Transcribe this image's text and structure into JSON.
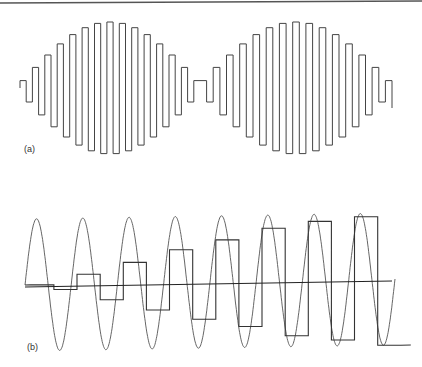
{
  "figure": {
    "panels": [
      {
        "id": "a",
        "label": "(a)",
        "description": "Square-wave (zero-order-hold) signal with two burst envelopes of increasing then decreasing amplitude"
      },
      {
        "id": "b",
        "label": "(b)",
        "description": "Sinusoid with growing-amplitude sample-and-hold staircase overlaid, plus horizontal zero axis"
      }
    ],
    "colors": {
      "line": "#444444",
      "axis": "#222222",
      "background": "#ffffff",
      "top_rule": "#555555"
    }
  },
  "chart_data": [
    {
      "type": "line",
      "title": "(a)",
      "panel": "a",
      "series": [
        {
          "name": "square-wave bursts",
          "center_y": 88,
          "bursts": [
            {
              "x_start": 20,
              "x_end": 200,
              "peak_half_amplitude": 66,
              "bars": 29
            },
            {
              "x_start": 200,
              "x_end": 392,
              "peak_half_amplitude": 66,
              "bars": 29
            }
          ]
        }
      ],
      "grid": false,
      "legend": null
    },
    {
      "type": "line",
      "title": "(b)",
      "panel": "b",
      "series": [
        {
          "name": "sinusoid",
          "cycles": 8,
          "x_start": 25,
          "x_end": 395,
          "center_y": 285,
          "amplitude": 66
        },
        {
          "name": "sample-and-hold staircase",
          "levels": [
            0,
            -5,
            10,
            -16,
            21,
            -27,
            33,
            -37,
            42,
            -45,
            53,
            -55,
            59,
            -60,
            63,
            -66
          ]
        },
        {
          "name": "zero axis",
          "y": 285
        }
      ],
      "grid": false,
      "legend": null
    }
  ]
}
